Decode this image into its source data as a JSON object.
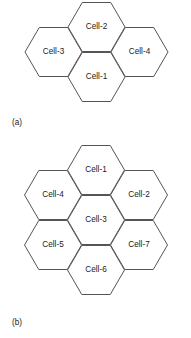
{
  "figure": {
    "background_color": "#ffffff",
    "stroke_color": "#555555",
    "text_color": "#1a1a1a",
    "panels": [
      {
        "id": "panel-a",
        "caption": "(a)",
        "caption_x": 12,
        "caption_y": 123,
        "cluster_size": 4,
        "cells": [
          {
            "label": "Cell-2",
            "cx": 96.5,
            "cy": 27,
            "role": "top-center"
          },
          {
            "label": "Cell-3",
            "cx": 53.5,
            "cy": 52,
            "role": "left"
          },
          {
            "label": "Cell-4",
            "cx": 139.5,
            "cy": 52,
            "role": "right"
          },
          {
            "label": "Cell-1",
            "cx": 96.5,
            "cy": 77,
            "role": "bottom-center"
          }
        ]
      },
      {
        "id": "panel-b",
        "caption": "(b)",
        "caption_x": 12,
        "caption_y": 323,
        "cluster_size": 7,
        "cells": [
          {
            "label": "Cell-1",
            "cx": 96,
            "cy": 170,
            "role": "top"
          },
          {
            "label": "Cell-4",
            "cx": 53,
            "cy": 195,
            "role": "upper-left"
          },
          {
            "label": "Cell-2",
            "cx": 139,
            "cy": 195,
            "role": "upper-right"
          },
          {
            "label": "Cell-3",
            "cx": 96,
            "cy": 220,
            "role": "center"
          },
          {
            "label": "Cell-5",
            "cx": 53,
            "cy": 245,
            "role": "lower-left"
          },
          {
            "label": "Cell-7",
            "cx": 139,
            "cy": 245,
            "role": "lower-right"
          },
          {
            "label": "Cell-6",
            "cx": 96,
            "cy": 270,
            "role": "bottom"
          }
        ]
      }
    ]
  }
}
